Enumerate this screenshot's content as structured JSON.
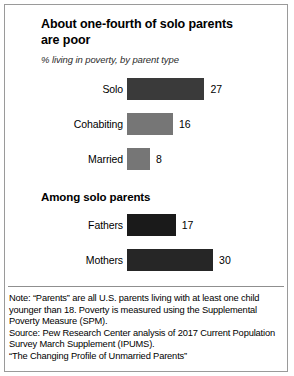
{
  "chart_data": {
    "type": "bar",
    "title": "About one-fourth of solo parents are poor",
    "subtitle": "% living in poverty, by parent type",
    "xlabel": "",
    "ylabel": "",
    "orientation": "horizontal",
    "grid": false,
    "legend": "none",
    "xlim": [
      0,
      30
    ],
    "sections": [
      {
        "heading": "",
        "categories": [
          "Solo",
          "Cohabiting",
          "Married"
        ],
        "values": [
          27,
          16,
          8
        ],
        "colors": [
          "#3a3a3a",
          "#767676",
          "#767676"
        ]
      },
      {
        "heading": "Among solo parents",
        "categories": [
          "Fathers",
          "Mothers"
        ],
        "values": [
          17,
          30
        ],
        "colors": [
          "#1a1a1a",
          "#262626"
        ]
      }
    ]
  },
  "footer": {
    "note": "Note: “Parents” are all U.S. parents living with at least one child younger than 18. Poverty is measured using the Supplemental Poverty Measure (SPM).",
    "source": "Source: Pew Research Center analysis of 2017 Current Population Survey March Supplement (IPUMS).",
    "report": "“The Changing Profile of Unmarried Parents”"
  }
}
